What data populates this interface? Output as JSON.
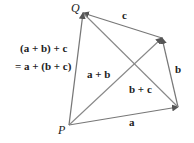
{
  "diagram": {
    "equation_line1": "(a + b) + c",
    "equation_line2": "= a + (b + c)",
    "points": {
      "P": {
        "label": "P",
        "x": 69,
        "y": 125
      },
      "R1": {
        "label": "",
        "x": 178,
        "y": 107
      },
      "R2": {
        "label": "",
        "x": 162,
        "y": 38
      },
      "Q": {
        "label": "Q",
        "x": 83,
        "y": 13
      }
    },
    "vectors": [
      {
        "name": "a",
        "label": "a",
        "from": "P",
        "to": "R1"
      },
      {
        "name": "b",
        "label": "b",
        "from": "R1",
        "to": "R2"
      },
      {
        "name": "c",
        "label": "c",
        "from": "R2",
        "to": "Q"
      },
      {
        "name": "a_plus_b",
        "label": "a + b",
        "from": "P",
        "to": "R2"
      },
      {
        "name": "b_plus_c",
        "label": "b + c",
        "from": "R1",
        "to": "Q"
      },
      {
        "name": "sum",
        "label": "",
        "from": "P",
        "to": "Q"
      }
    ],
    "colors": {
      "line": "#777777",
      "text": "#222222"
    }
  }
}
